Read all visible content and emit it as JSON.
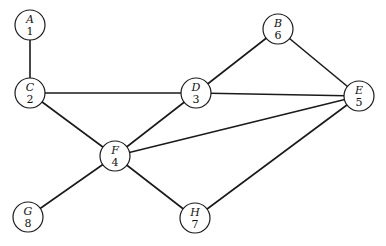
{
  "graph": {
    "nodes": [
      {
        "id": "A",
        "label": "A",
        "number": "1",
        "x": 30,
        "y": 25
      },
      {
        "id": "C",
        "label": "C",
        "number": "2",
        "x": 30,
        "y": 93
      },
      {
        "id": "D",
        "label": "D",
        "number": "3",
        "x": 196,
        "y": 93
      },
      {
        "id": "F",
        "label": "F",
        "number": "4",
        "x": 115,
        "y": 156
      },
      {
        "id": "E",
        "label": "E",
        "number": "5",
        "x": 359,
        "y": 96
      },
      {
        "id": "B",
        "label": "B",
        "number": "6",
        "x": 278,
        "y": 29
      },
      {
        "id": "H",
        "label": "H",
        "number": "7",
        "x": 195,
        "y": 218
      },
      {
        "id": "G",
        "label": "G",
        "number": "8",
        "x": 28,
        "y": 217
      }
    ],
    "edges": [
      [
        "A",
        "C"
      ],
      [
        "C",
        "D"
      ],
      [
        "C",
        "F"
      ],
      [
        "D",
        "B"
      ],
      [
        "D",
        "E"
      ],
      [
        "D",
        "F"
      ],
      [
        "B",
        "E"
      ],
      [
        "F",
        "E"
      ],
      [
        "F",
        "G"
      ],
      [
        "F",
        "H"
      ],
      [
        "H",
        "E"
      ]
    ],
    "node_radius": 15
  }
}
